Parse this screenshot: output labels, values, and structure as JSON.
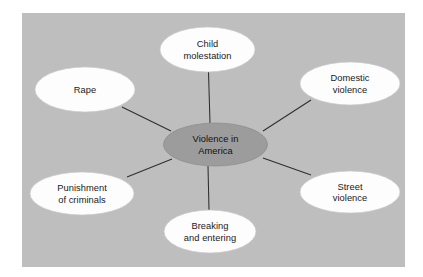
{
  "diagram": {
    "type": "concept-map",
    "title_node": "Violence in America",
    "background_color": "#bebebe",
    "page_color": "#ffffff",
    "center_node_color": "#9c9c9c",
    "satellite_node_color": "#fdfdfd",
    "connector_color": "#2e2e2e",
    "center": {
      "name": "center-node",
      "lines": [
        "Violence in",
        "America"
      ],
      "cx": 215.5,
      "cy": 144.5,
      "rx": 52,
      "ry": 21.5
    },
    "satellites": [
      {
        "name": "child-molestation",
        "lines": [
          "Child",
          "molestation"
        ],
        "cx": 207.5,
        "cy": 49.5,
        "rx": 47.5,
        "ry": 22.5,
        "line": {
          "x1": 208.5,
          "y1": 72,
          "x2": 210,
          "y2": 123
        }
      },
      {
        "name": "domestic-violence",
        "lines": [
          "Domestic",
          "violence"
        ],
        "cx": 350,
        "cy": 83.5,
        "rx": 50,
        "ry": 21.5,
        "line": {
          "x1": 311,
          "y1": 100,
          "x2": 263,
          "y2": 131
        }
      },
      {
        "name": "street-violence",
        "lines": [
          "Street",
          "violence"
        ],
        "cx": 350,
        "cy": 192,
        "rx": 50,
        "ry": 21,
        "line": {
          "x1": 311,
          "y1": 175,
          "x2": 263,
          "y2": 158
        }
      },
      {
        "name": "breaking-and-entering",
        "lines": [
          "Breaking",
          "and entering"
        ],
        "cx": 210,
        "cy": 231.5,
        "rx": 46,
        "ry": 21.5,
        "line": {
          "x1": 209,
          "y1": 210,
          "x2": 208,
          "y2": 166
        }
      },
      {
        "name": "punishment-of-criminals",
        "lines": [
          "Punishment",
          "of criminals"
        ],
        "cx": 82,
        "cy": 193.5,
        "rx": 52,
        "ry": 21.5,
        "line": {
          "x1": 127,
          "y1": 177,
          "x2": 172,
          "y2": 159
        }
      },
      {
        "name": "rape",
        "lines": [
          "Rape"
        ],
        "cx": 85,
        "cy": 89.5,
        "rx": 50,
        "ry": 22.5,
        "line": {
          "x1": 122,
          "y1": 107,
          "x2": 171,
          "y2": 131
        }
      }
    ]
  }
}
